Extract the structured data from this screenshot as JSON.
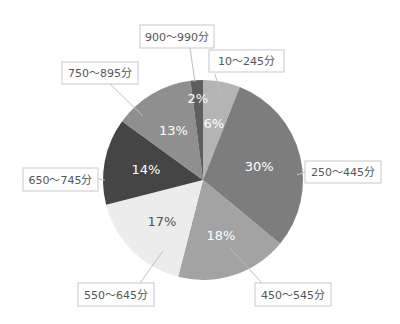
{
  "chart_data": {
    "type": "pie",
    "title": "",
    "start_angle_deg": 0,
    "direction": "clockwise",
    "slices": [
      {
        "label": "10～245分",
        "value": 6,
        "display": "6%",
        "color": "#b4b4b4",
        "text_color": "#ffffff"
      },
      {
        "label": "250～445分",
        "value": 30,
        "display": "30%",
        "color": "#7d7d7d",
        "text_color": "#ffffff"
      },
      {
        "label": "450～545分",
        "value": 18,
        "display": "18%",
        "color": "#a3a3a3",
        "text_color": "#ffffff"
      },
      {
        "label": "550～645分",
        "value": 17,
        "display": "17%",
        "color": "#ececec",
        "text_color": "#555555"
      },
      {
        "label": "650～745分",
        "value": 14,
        "display": "14%",
        "color": "#454545",
        "text_color": "#ffffff"
      },
      {
        "label": "750～895分",
        "value": 13,
        "display": "13%",
        "color": "#8f8f8f",
        "text_color": "#ffffff"
      },
      {
        "label": "900～990分",
        "value": 2,
        "display": "2%",
        "color": "#5e5e5e",
        "text_color": "#ffffff"
      }
    ],
    "legend": "callout labels"
  }
}
